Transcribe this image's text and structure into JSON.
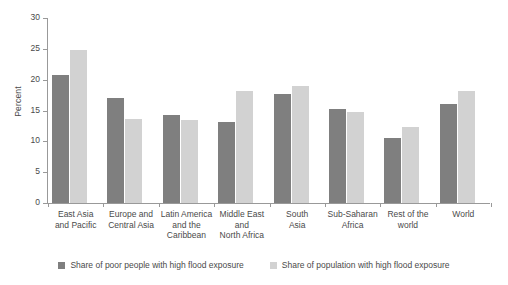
{
  "chart_data": {
    "type": "bar",
    "title": "",
    "subtitle": "",
    "xlabel": "",
    "ylabel": "Percent",
    "ylim": [
      0,
      30
    ],
    "yticks": [
      0,
      5,
      10,
      15,
      20,
      25,
      30
    ],
    "ytick_labels": [
      "0",
      "5",
      "10",
      "15",
      "20",
      "25",
      "30"
    ],
    "grid": false,
    "legend_position": "bottom",
    "categories": [
      "East Asia and Pacific",
      "Europe and Central Asia",
      "Latin America and the Caribbean",
      "Middle East and North Africa",
      "South Asia",
      "Sub-Saharan Africa",
      "Rest of the world",
      "World"
    ],
    "category_lines": [
      [
        "East Asia",
        "and Pacific"
      ],
      [
        "Europe and",
        "Central Asia"
      ],
      [
        "Latin America",
        "and the",
        "Caribbean"
      ],
      [
        "Middle East",
        "and",
        "North Africa"
      ],
      [
        "South",
        "Asia"
      ],
      [
        "Sub-Saharan",
        "Africa"
      ],
      [
        "Rest of the",
        "world"
      ],
      [
        "World"
      ]
    ],
    "series": [
      {
        "name": "Share of poor people with high flood exposure",
        "color": "#7f7f7f",
        "values": [
          20.8,
          17.1,
          14.2,
          13.2,
          17.6,
          15.2,
          10.5,
          16.0
        ]
      },
      {
        "name": "Share of population with high flood exposure",
        "color": "#d2d2d2",
        "values": [
          24.8,
          13.7,
          13.4,
          18.1,
          19.0,
          14.7,
          12.3,
          18.2
        ]
      }
    ]
  },
  "legend": {
    "items": [
      {
        "label": "Share of poor people with high flood exposure"
      },
      {
        "label": "Share of population with high flood exposure"
      }
    ]
  },
  "colors": {
    "series_dark": "#7f7f7f",
    "series_light": "#d2d2d2",
    "axis": "#999999",
    "text": "#4a4a4a",
    "background": "#ffffff"
  }
}
